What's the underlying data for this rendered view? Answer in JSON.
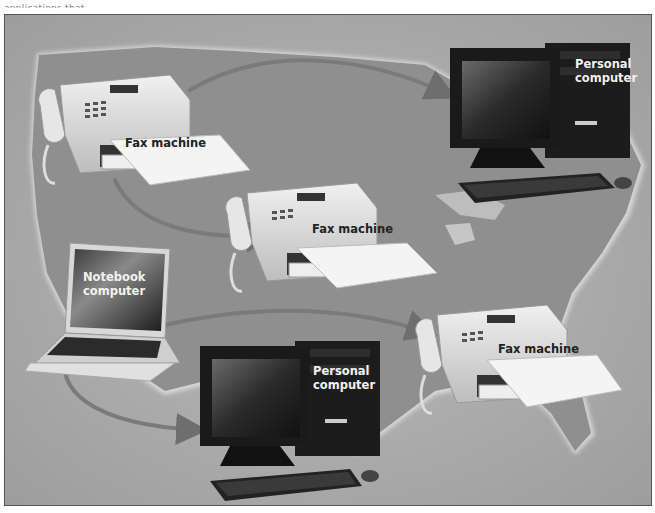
{
  "caption_fragment": "applications that...",
  "diagram": {
    "nodes": [
      {
        "id": "fax-1",
        "type": "fax machine",
        "label": "Fax machine"
      },
      {
        "id": "pc-1",
        "type": "personal computer",
        "label_line1": "Personal",
        "label_line2": "computer"
      },
      {
        "id": "fax-2",
        "type": "fax machine",
        "label": "Fax machine"
      },
      {
        "id": "notebook-1",
        "type": "notebook computer",
        "label_line1": "Notebook",
        "label_line2": "computer"
      },
      {
        "id": "fax-3",
        "type": "fax machine",
        "label": "Fax machine"
      },
      {
        "id": "pc-2",
        "type": "personal computer",
        "label_line1": "Personal",
        "label_line2": "computer"
      }
    ],
    "connections": [
      {
        "from": "fax-1",
        "to": "pc-1"
      },
      {
        "from": "fax-1",
        "to": "fax-2"
      },
      {
        "from": "notebook-1",
        "to": "fax-3"
      },
      {
        "from": "notebook-1",
        "to": "pc-2"
      }
    ],
    "background": "map of the United States"
  },
  "colors": {
    "background": "#a9a9a9",
    "map": "#8f8f8f",
    "arrow": "#7a7a7a",
    "label_dark": "#222222",
    "label_light": "#f2f2f2"
  }
}
